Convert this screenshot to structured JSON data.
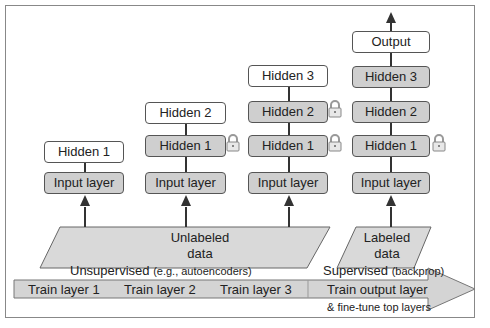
{
  "columns": [
    {
      "layers": [
        {
          "label": "Hidden 1",
          "style": "white",
          "locked": false
        },
        {
          "label": "Input layer",
          "style": "gray",
          "locked": false
        }
      ]
    },
    {
      "layers": [
        {
          "label": "Hidden 2",
          "style": "white",
          "locked": false
        },
        {
          "label": "Hidden 1",
          "style": "gray",
          "locked": true
        },
        {
          "label": "Input layer",
          "style": "gray",
          "locked": false
        }
      ]
    },
    {
      "layers": [
        {
          "label": "Hidden 3",
          "style": "white",
          "locked": false
        },
        {
          "label": "Hidden 2",
          "style": "gray",
          "locked": true
        },
        {
          "label": "Hidden 1",
          "style": "gray",
          "locked": true
        },
        {
          "label": "Input layer",
          "style": "gray",
          "locked": false
        }
      ]
    },
    {
      "layers": [
        {
          "label": "Output",
          "style": "white",
          "locked": false
        },
        {
          "label": "Hidden 3",
          "style": "gray",
          "locked": false
        },
        {
          "label": "Hidden 2",
          "style": "gray",
          "locked": false
        },
        {
          "label": "Hidden 1",
          "style": "gray",
          "locked": true
        },
        {
          "label": "Input layer",
          "style": "gray",
          "locked": false
        }
      ]
    }
  ],
  "data_blocks": {
    "unlabeled": {
      "line1": "Unlabeled",
      "line2": "data"
    },
    "labeled": {
      "line1": "Labeled",
      "line2": "data"
    }
  },
  "phases": {
    "unsupervised": {
      "main": "Unsupervised",
      "note": "(e.g., autoencoders)"
    },
    "supervised": {
      "main": "Supervised",
      "note": "(backprop)"
    }
  },
  "timeline": {
    "steps": [
      "Train layer 1",
      "Train layer 2",
      "Train layer 3",
      "Train output layer"
    ],
    "sub_note": "& fine-tune top layers"
  },
  "colors": {
    "gray_fill": "#cfcfcf",
    "stroke": "#333333",
    "data_fill": "#d9d9d9",
    "arrow_fill": "#d4d4d4"
  }
}
